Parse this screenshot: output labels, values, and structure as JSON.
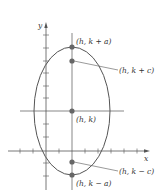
{
  "diagram": {
    "axes": {
      "x_label": "x",
      "y_label": "y"
    },
    "points": [
      {
        "id": "vertex-top",
        "label": "(h, k + a)"
      },
      {
        "id": "focus-top",
        "label": "(h, k + c)"
      },
      {
        "id": "center",
        "label": "(h, k)"
      },
      {
        "id": "focus-bottom",
        "label": "(h, k − c)"
      },
      {
        "id": "vertex-bottom",
        "label": "(h, k − a)"
      }
    ],
    "colors": {
      "stroke": "#555555",
      "point": "#666666",
      "text": "#333333"
    }
  }
}
